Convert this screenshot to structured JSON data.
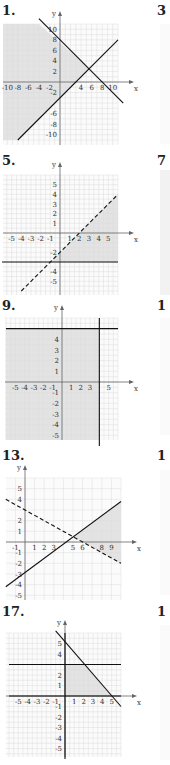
{
  "chart_data": [
    {
      "id": "1",
      "label": "1.",
      "type": "line",
      "title": "Graph of system of linear inequalities",
      "xlabel": "x",
      "ylabel": "y",
      "xlim": [
        -11,
        11
      ],
      "ylim": [
        -11,
        11
      ],
      "grid": true,
      "x_ticks": [
        "-10",
        "-8",
        "-6",
        "-4",
        "-2",
        "4",
        "6",
        "8",
        "10"
      ],
      "y_ticks": [
        "10",
        "8",
        "6",
        "4",
        "2",
        "-2",
        "-6",
        "-8",
        "-10"
      ],
      "lines": [
        {
          "name": "boundary-1",
          "style": "solid",
          "from": [
            -4,
            12
          ],
          "to": [
            12,
            -4
          ],
          "equation": "x + y = 8"
        },
        {
          "name": "boundary-2",
          "style": "solid",
          "from": [
            -8,
            -11
          ],
          "to": [
            11,
            8
          ],
          "equation": "y = x - 3"
        }
      ],
      "shaded_region": "left of both lines (x + y <= 8 and y >= x - 3)"
    },
    {
      "id": "5",
      "label": "5.",
      "type": "line",
      "xlabel": "x",
      "ylabel": "y",
      "xlim": [
        -6,
        6
      ],
      "ylim": [
        -6,
        6
      ],
      "grid": true,
      "x_ticks": [
        "-5",
        "-4",
        "-3",
        "-2",
        "-1",
        "1",
        "2",
        "3",
        "4",
        "5"
      ],
      "y_ticks": [
        "5",
        "4",
        "3",
        "2",
        "1",
        "-2",
        "-4",
        "-5"
      ],
      "lines": [
        {
          "name": "boundary-1",
          "style": "dashed",
          "from": [
            -4,
            -6
          ],
          "to": [
            6,
            4
          ],
          "equation": "y = x - 2"
        },
        {
          "name": "boundary-2",
          "style": "solid",
          "from": [
            -6,
            -3
          ],
          "to": [
            6,
            -3
          ],
          "equation": "y = -3"
        }
      ],
      "shaded_region": "below dashed line and above y = -3"
    },
    {
      "id": "9",
      "label": "9.",
      "type": "line",
      "xlabel": "x",
      "ylabel": "y",
      "xlim": [
        -6,
        6
      ],
      "ylim": [
        -6,
        6
      ],
      "grid": true,
      "x_ticks": [
        "-5",
        "-4",
        "-3",
        "-2",
        "-1",
        "1",
        "2",
        "3",
        "5"
      ],
      "y_ticks": [
        "4",
        "3",
        "2",
        "1",
        "-1",
        "-2",
        "-3",
        "-4",
        "-5"
      ],
      "lines": [
        {
          "name": "boundary-1",
          "style": "solid",
          "from": [
            -6,
            5
          ],
          "to": [
            6,
            5
          ],
          "equation": "y = 5"
        },
        {
          "name": "boundary-2",
          "style": "solid",
          "from": [
            4,
            6
          ],
          "to": [
            4,
            -6
          ],
          "equation": "x = 4"
        }
      ],
      "shaded_region": "y <= 5 and x <= 4"
    },
    {
      "id": "13",
      "label": "13.",
      "type": "line",
      "xlabel": "x",
      "ylabel": "y",
      "xlim": [
        -2,
        10
      ],
      "ylim": [
        -6,
        6
      ],
      "grid": true,
      "x_ticks": [
        "-1",
        "1",
        "2",
        "3",
        "5",
        "6",
        "8",
        "9"
      ],
      "y_ticks": [
        "5",
        "4",
        "2",
        "1",
        "-1",
        "-2",
        "-3",
        "-4",
        "-5"
      ],
      "lines": [
        {
          "name": "boundary-1",
          "style": "dashed",
          "from": [
            -2,
            4
          ],
          "to": [
            10,
            -2
          ],
          "equation": "x + 2y = 6"
        },
        {
          "name": "boundary-2",
          "style": "solid",
          "from": [
            -2,
            -4.2
          ],
          "to": [
            10,
            3.8
          ],
          "equation": "2x - 3y = 9"
        }
      ],
      "shaded_region": "right, between lines for x > ~5"
    },
    {
      "id": "17",
      "label": "17.",
      "type": "line",
      "xlabel": "x",
      "ylabel": "y",
      "xlim": [
        -6,
        6
      ],
      "ylim": [
        -6,
        6
      ],
      "grid": true,
      "x_ticks": [
        "-5",
        "-4",
        "-3",
        "-2",
        "-1",
        "1",
        "2",
        "3",
        "4",
        "5"
      ],
      "y_ticks": [
        "5",
        "4",
        "2",
        "1",
        "-1",
        "-2",
        "-3",
        "-4",
        "-5"
      ],
      "lines": [
        {
          "name": "boundary-1",
          "style": "solid",
          "from": [
            -1,
            6.2
          ],
          "to": [
            6,
            -1
          ],
          "equation": "x + y = 5"
        },
        {
          "name": "boundary-2",
          "style": "solid",
          "from": [
            -6,
            3
          ],
          "to": [
            6,
            3
          ],
          "equation": "y = 3"
        },
        {
          "name": "boundary-3",
          "style": "solid",
          "from": [
            -6,
            0
          ],
          "to": [
            6,
            0
          ],
          "equation": "y = 0"
        },
        {
          "name": "boundary-4",
          "style": "solid",
          "from": [
            0,
            6
          ],
          "to": [
            0,
            -6
          ],
          "equation": "x = 0"
        }
      ],
      "shaded_region": "0 <= y <= 3, x >= 0, x + y <= 5"
    }
  ],
  "panels": [
    {
      "label": "1."
    },
    {
      "label": "5."
    },
    {
      "label": "9."
    },
    {
      "label": "13."
    },
    {
      "label": "17."
    }
  ],
  "right_column_labels": [
    "3",
    "7",
    "1",
    "1",
    "1"
  ],
  "axis": {
    "x": "x",
    "y": "y"
  }
}
